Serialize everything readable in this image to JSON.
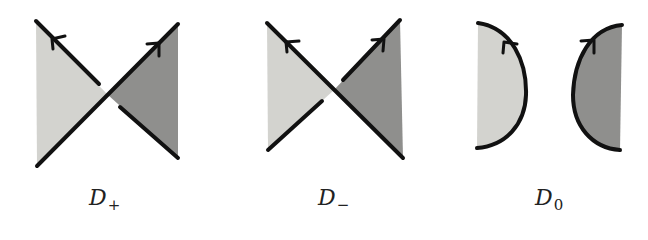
{
  "figure": {
    "colors": {
      "light_fill": "#d3d3cf",
      "dark_fill": "#8f8f8d",
      "stroke": "#111111",
      "background": "#ffffff"
    },
    "panels": [
      {
        "id": "d-plus",
        "symbol": "D",
        "subscript": "+",
        "kind": "positive-crossing"
      },
      {
        "id": "d-minus",
        "symbol": "D",
        "subscript": "−",
        "kind": "negative-crossing"
      },
      {
        "id": "d-zero",
        "symbol": "D",
        "subscript": "0",
        "kind": "oriented-smoothing"
      }
    ]
  }
}
